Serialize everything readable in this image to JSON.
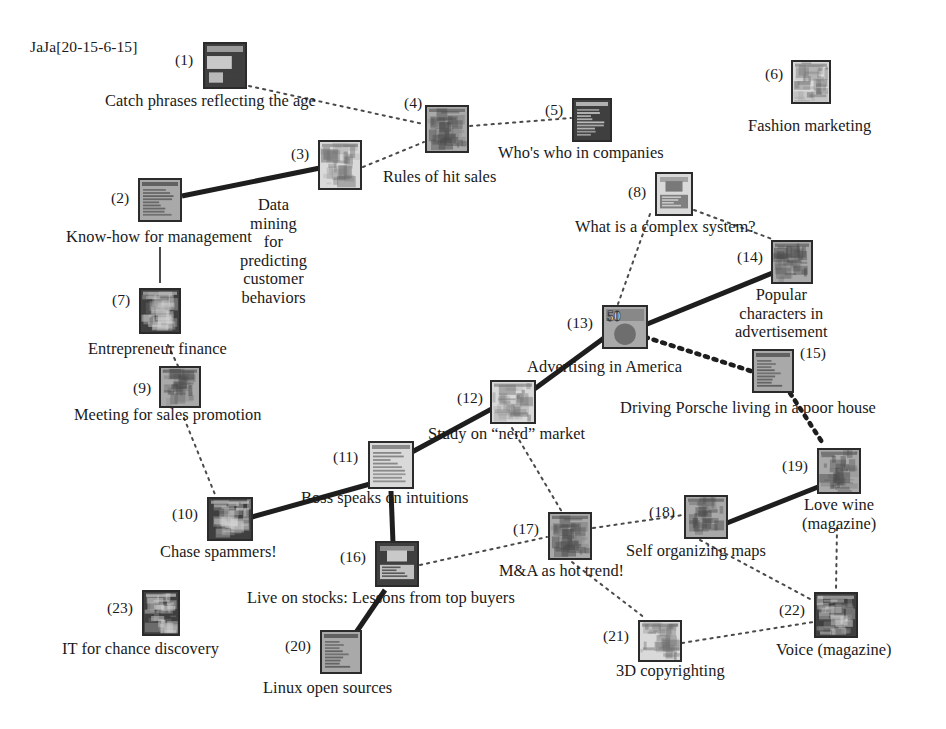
{
  "header": {
    "label": "JaJa[20-15-6-15]"
  },
  "diagram": {
    "type": "network-graph",
    "node_count": 23,
    "nodes": [
      {
        "id": 1,
        "num": "(1)",
        "caption": "Catch phrases reflecting the age",
        "x": 203,
        "y": 42,
        "w": 44,
        "h": 47,
        "num_side": "left",
        "num_x": 175,
        "num_y": 52,
        "cap_x": 105,
        "cap_y": 92,
        "tone": "dark",
        "style": "mixed"
      },
      {
        "id": 2,
        "num": "(2)",
        "caption": "Know-how for management",
        "x": 138,
        "y": 178,
        "w": 44,
        "h": 44,
        "num_side": "left",
        "num_x": 111,
        "num_y": 190,
        "cap_x": 66,
        "cap_y": 228,
        "tone": "mid",
        "style": "text"
      },
      {
        "id": 3,
        "num": "(3)",
        "caption": "Data mining for predicting\ncustomer behaviors",
        "x": 318,
        "y": 140,
        "w": 44,
        "h": 50,
        "num_side": "left",
        "num_x": 291,
        "num_y": 146,
        "cap_x": 240,
        "cap_y": 196,
        "tone": "light",
        "style": "photo",
        "two_line": true
      },
      {
        "id": 4,
        "num": "(4)",
        "caption": "Rules of hit sales",
        "x": 425,
        "y": 105,
        "w": 44,
        "h": 48,
        "num_side": "top",
        "num_x": 404,
        "num_y": 95,
        "cap_x": 383,
        "cap_y": 168,
        "tone": "mid",
        "style": "photo"
      },
      {
        "id": 5,
        "num": "(5)",
        "caption": "Who's who in companies",
        "x": 572,
        "y": 98,
        "w": 40,
        "h": 44,
        "num_side": "left",
        "num_x": 545,
        "num_y": 102,
        "cap_x": 498,
        "cap_y": 144,
        "tone": "dark",
        "style": "text"
      },
      {
        "id": 6,
        "num": "(6)",
        "caption": "Fashion marketing",
        "x": 791,
        "y": 60,
        "w": 40,
        "h": 44,
        "num_side": "left",
        "num_x": 765,
        "num_y": 66,
        "cap_x": 748,
        "cap_y": 117,
        "tone": "light",
        "style": "photo"
      },
      {
        "id": 7,
        "num": "(7)",
        "caption": "Entrepreneur finance",
        "x": 139,
        "y": 288,
        "w": 42,
        "h": 46,
        "num_side": "left",
        "num_x": 112,
        "num_y": 292,
        "cap_x": 88,
        "cap_y": 340,
        "tone": "dark",
        "style": "photo"
      },
      {
        "id": 8,
        "num": "(8)",
        "caption": "What is a complex system?",
        "x": 655,
        "y": 172,
        "w": 38,
        "h": 44,
        "num_side": "left",
        "num_x": 628,
        "num_y": 184,
        "cap_x": 575,
        "cap_y": 218,
        "tone": "light",
        "style": "blocks"
      },
      {
        "id": 9,
        "num": "(9)",
        "caption": "Meeting for sales promotion",
        "x": 159,
        "y": 366,
        "w": 42,
        "h": 42,
        "num_side": "left",
        "num_x": 133,
        "num_y": 380,
        "cap_x": 74,
        "cap_y": 406,
        "tone": "mid",
        "style": "photo"
      },
      {
        "id": 10,
        "num": "(10)",
        "caption": "Chase spammers!",
        "x": 207,
        "y": 497,
        "w": 46,
        "h": 44,
        "num_side": "left",
        "num_x": 172,
        "num_y": 506,
        "cap_x": 160,
        "cap_y": 543,
        "tone": "dark",
        "style": "photo"
      },
      {
        "id": 11,
        "num": "(11)",
        "caption": "Boss speaks on intuitions",
        "x": 368,
        "y": 441,
        "w": 46,
        "h": 48,
        "num_side": "left",
        "num_x": 333,
        "num_y": 449,
        "cap_x": 301,
        "cap_y": 489,
        "tone": "light",
        "style": "text"
      },
      {
        "id": 12,
        "num": "(12)",
        "caption": "Study on “nerd” market",
        "x": 490,
        "y": 380,
        "w": 46,
        "h": 44,
        "num_side": "left",
        "num_x": 457,
        "num_y": 390,
        "cap_x": 428,
        "cap_y": 425,
        "tone": "light",
        "style": "photo"
      },
      {
        "id": 13,
        "num": "(13)",
        "caption": "Advertising in America",
        "x": 602,
        "y": 305,
        "w": 46,
        "h": 44,
        "num_side": "left",
        "num_x": 567,
        "num_y": 315,
        "cap_x": 527,
        "cap_y": 358,
        "tone": "mid",
        "style": "fifty"
      },
      {
        "id": 14,
        "num": "(14)",
        "caption": "Popular characters in\nadvertisement",
        "x": 771,
        "y": 240,
        "w": 42,
        "h": 44,
        "num_side": "left",
        "num_x": 737,
        "num_y": 249,
        "cap_x": 735,
        "cap_y": 286,
        "tone": "mid",
        "style": "photo",
        "two_line": true
      },
      {
        "id": 15,
        "num": "(15)",
        "caption": "Driving Porsche living in a poor house",
        "x": 752,
        "y": 349,
        "w": 42,
        "h": 44,
        "num_side": "right",
        "num_x": 800,
        "num_y": 345,
        "cap_x": 620,
        "cap_y": 399,
        "tone": "mid",
        "style": "text"
      },
      {
        "id": 16,
        "num": "(16)",
        "caption": "Live on stocks: Lessons from top buyers",
        "x": 375,
        "y": 541,
        "w": 44,
        "h": 46,
        "num_side": "left",
        "num_x": 340,
        "num_y": 549,
        "cap_x": 247,
        "cap_y": 589,
        "tone": "dark",
        "style": "blocks"
      },
      {
        "id": 17,
        "num": "(17)",
        "caption": "M&A as hot trend!",
        "x": 548,
        "y": 512,
        "w": 44,
        "h": 48,
        "num_side": "left",
        "num_x": 513,
        "num_y": 521,
        "cap_x": 499,
        "cap_y": 562,
        "tone": "mid",
        "style": "photo"
      },
      {
        "id": 18,
        "num": "(18)",
        "caption": "Self organizing maps",
        "x": 684,
        "y": 495,
        "w": 44,
        "h": 44,
        "num_side": "left",
        "num_x": 649,
        "num_y": 504,
        "cap_x": 626,
        "cap_y": 542,
        "tone": "mid",
        "style": "photo"
      },
      {
        "id": 19,
        "num": "(19)",
        "caption": "Love wine\n(magazine)",
        "x": 817,
        "y": 448,
        "w": 44,
        "h": 46,
        "num_side": "left",
        "num_x": 782,
        "num_y": 458,
        "cap_x": 802,
        "cap_y": 496,
        "tone": "mid",
        "style": "photo",
        "two_line": true
      },
      {
        "id": 20,
        "num": "(20)",
        "caption": "Linux open sources",
        "x": 320,
        "y": 630,
        "w": 42,
        "h": 44,
        "num_side": "left",
        "num_x": 285,
        "num_y": 638,
        "cap_x": 263,
        "cap_y": 679,
        "tone": "mid",
        "style": "text"
      },
      {
        "id": 21,
        "num": "(21)",
        "caption": "3D copyrighting",
        "x": 638,
        "y": 620,
        "w": 44,
        "h": 42,
        "num_side": "left",
        "num_x": 603,
        "num_y": 628,
        "cap_x": 616,
        "cap_y": 662,
        "tone": "light",
        "style": "photo"
      },
      {
        "id": 22,
        "num": "(22)",
        "caption": "Voice (magazine)",
        "x": 814,
        "y": 592,
        "w": 44,
        "h": 46,
        "num_side": "left",
        "num_x": 779,
        "num_y": 602,
        "cap_x": 776,
        "cap_y": 641,
        "tone": "dark",
        "style": "photo"
      },
      {
        "id": 23,
        "num": "(23)",
        "caption": "IT for chance discovery",
        "x": 142,
        "y": 590,
        "w": 38,
        "h": 46,
        "num_side": "left",
        "num_x": 107,
        "num_y": 600,
        "cap_x": 62,
        "cap_y": 640,
        "tone": "dark",
        "style": "photo"
      }
    ],
    "edges": [
      {
        "from": 1,
        "to": 4,
        "kind": "thin-dotted",
        "x1": 249,
        "y1": 86,
        "x2": 423,
        "y2": 124
      },
      {
        "from": 2,
        "to": 3,
        "kind": "thick-solid",
        "x1": 182,
        "y1": 196,
        "x2": 320,
        "y2": 168
      },
      {
        "from": 3,
        "to": 4,
        "kind": "thin-dotted",
        "x1": 363,
        "y1": 167,
        "x2": 424,
        "y2": 142
      },
      {
        "from": 4,
        "to": 5,
        "kind": "thin-dotted",
        "x1": 470,
        "y1": 126,
        "x2": 571,
        "y2": 118
      },
      {
        "from": 2,
        "to": 7,
        "kind": "thin-solid",
        "x1": 160,
        "y1": 247,
        "x2": 160,
        "y2": 283
      },
      {
        "from": 7,
        "to": 9,
        "kind": "thin-dotted",
        "x1": 168,
        "y1": 345,
        "x2": 178,
        "y2": 366
      },
      {
        "from": 9,
        "to": 10,
        "kind": "thin-dotted",
        "x1": 184,
        "y1": 418,
        "x2": 216,
        "y2": 497
      },
      {
        "from": 10,
        "to": 11,
        "kind": "thick-solid",
        "x1": 252,
        "y1": 517,
        "x2": 370,
        "y2": 484
      },
      {
        "from": 11,
        "to": 12,
        "kind": "thick-solid",
        "x1": 412,
        "y1": 452,
        "x2": 534,
        "y2": 386
      },
      {
        "from": 11,
        "to": 16,
        "kind": "thick-solid",
        "x1": 391,
        "y1": 491,
        "x2": 393,
        "y2": 543
      },
      {
        "from": 12,
        "to": 13,
        "kind": "thick-solid",
        "x1": 533,
        "y1": 390,
        "x2": 604,
        "y2": 338
      },
      {
        "from": 8,
        "to": 13,
        "kind": "thin-dotted",
        "x1": 650,
        "y1": 214,
        "x2": 618,
        "y2": 304
      },
      {
        "from": 8,
        "to": 14,
        "kind": "thin-dotted",
        "x1": 694,
        "y1": 210,
        "x2": 772,
        "y2": 239
      },
      {
        "from": 13,
        "to": 14,
        "kind": "thick-solid",
        "x1": 630,
        "y1": 331,
        "x2": 775,
        "y2": 272
      },
      {
        "from": 13,
        "to": 15,
        "kind": "thick-dotted",
        "x1": 645,
        "y1": 337,
        "x2": 754,
        "y2": 372
      },
      {
        "from": 15,
        "to": 19,
        "kind": "thick-dotted",
        "x1": 790,
        "y1": 393,
        "x2": 824,
        "y2": 445
      },
      {
        "from": 12,
        "to": 17,
        "kind": "thin-dotted",
        "x1": 512,
        "y1": 428,
        "x2": 562,
        "y2": 512
      },
      {
        "from": 16,
        "to": 17,
        "kind": "thin-dotted",
        "x1": 420,
        "y1": 565,
        "x2": 547,
        "y2": 537
      },
      {
        "from": 17,
        "to": 18,
        "kind": "thin-dotted",
        "x1": 593,
        "y1": 528,
        "x2": 683,
        "y2": 515
      },
      {
        "from": 18,
        "to": 19,
        "kind": "thick-solid",
        "x1": 727,
        "y1": 523,
        "x2": 818,
        "y2": 487
      },
      {
        "from": 18,
        "to": 22,
        "kind": "thin-dotted",
        "x1": 700,
        "y1": 540,
        "x2": 812,
        "y2": 600
      },
      {
        "from": 19,
        "to": 22,
        "kind": "thin-dotted",
        "x1": 837,
        "y1": 528,
        "x2": 836,
        "y2": 590
      },
      {
        "from": 21,
        "to": 22,
        "kind": "thin-dotted",
        "x1": 682,
        "y1": 643,
        "x2": 813,
        "y2": 622
      },
      {
        "from": 17,
        "to": 21,
        "kind": "thin-dotted",
        "x1": 572,
        "y1": 562,
        "x2": 645,
        "y2": 618
      },
      {
        "from": 20,
        "to": 16,
        "kind": "thick-solid",
        "x1": 355,
        "y1": 634,
        "x2": 385,
        "y2": 590
      }
    ]
  },
  "colors": {
    "ink": "#1a1a1a",
    "edge_dark": "#1e1e1e",
    "edge_gray": "#4a4a4a",
    "cover_border": "#2b2b2b",
    "cover_light": "#d8d8d8",
    "cover_mid": "#a8a8a8",
    "cover_dark": "#4c4c4c",
    "page": "#ffffff"
  }
}
